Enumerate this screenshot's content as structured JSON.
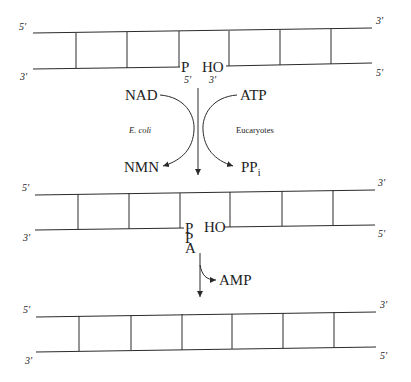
{
  "diagram": {
    "duplex_top": {
      "top_left_label": "5′",
      "top_right_label": "3′",
      "bottom_left_label": "3′",
      "bottom_right_label": "5′",
      "nick_left_label": "P",
      "nick_right_label": "HO",
      "nick_left_end": "5′",
      "nick_right_end": "3′"
    },
    "cofactors": {
      "left_substrate": "NAD",
      "left_product": "NMN",
      "left_organism": "E. coli",
      "right_substrate": "ATP",
      "right_product": "PP",
      "right_product_subscript": "i",
      "right_organism": "Eucaryotes"
    },
    "duplex_middle": {
      "top_left_label": "5′",
      "top_right_label": "3′",
      "bottom_left_label": "3′",
      "bottom_right_label": "5′",
      "adenylate_labels": [
        "P",
        "P",
        "A"
      ],
      "nick_right_label": "HO"
    },
    "release": {
      "product": "AMP"
    },
    "duplex_bottom": {
      "top_left_label": "5′",
      "top_right_label": "3′",
      "bottom_left_label": "3′",
      "bottom_right_label": "5′"
    }
  }
}
